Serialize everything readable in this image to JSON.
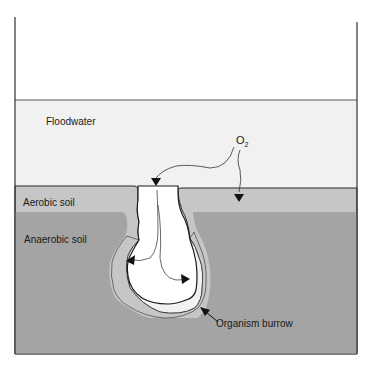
{
  "diagram": {
    "labels": {
      "floodwater": "Floodwater",
      "oxygen": "O",
      "oxygen_subscript": "2",
      "aerobic_soil": "Aerobic soil",
      "anaerobic_soil": "Anaerobic soil",
      "organism_burrow": "Organism burrow"
    },
    "colors": {
      "floodwater": "#f1f1f1",
      "aerobic_soil": "#c6c6c6",
      "anaerobic_soil": "#a4a4a4",
      "burrow_interior": "#ffffff",
      "outline": "#2a2a2a"
    }
  }
}
